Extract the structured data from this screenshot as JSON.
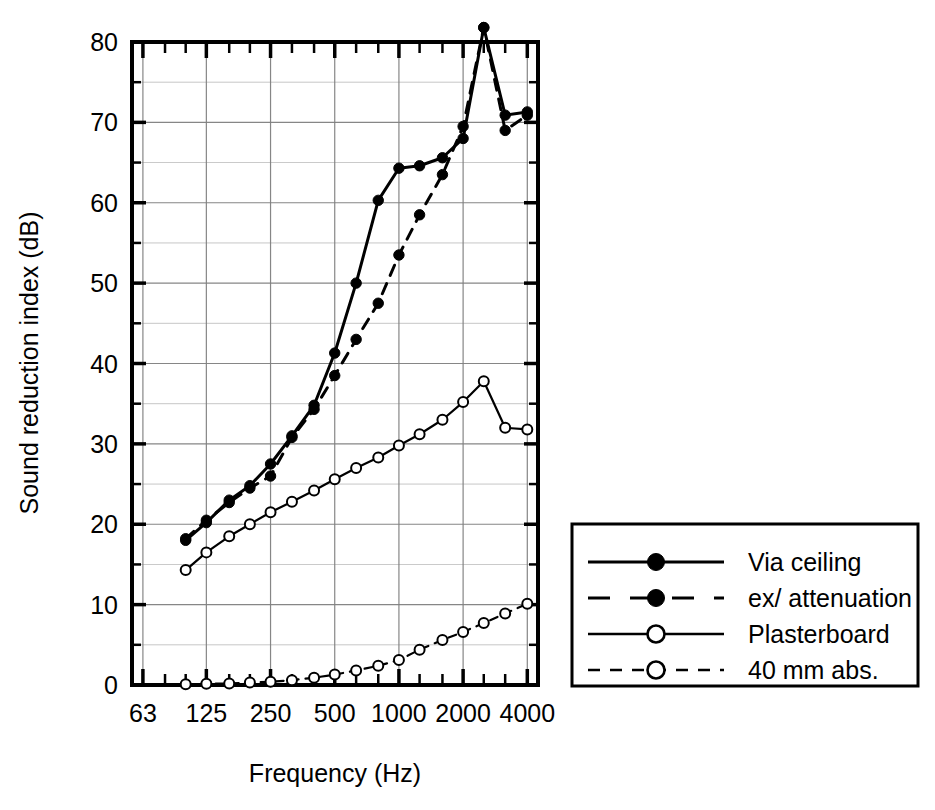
{
  "chart_data": {
    "type": "line",
    "title": "",
    "xlabel": "Frequency (Hz)",
    "ylabel": "Sound reduction index (dB)",
    "xscale": "log",
    "xlim": [
      56,
      4490
    ],
    "ylim": [
      0,
      80
    ],
    "yticks": [
      0,
      10,
      20,
      30,
      40,
      50,
      60,
      70,
      80
    ],
    "ytick_labels": [
      "0",
      "10",
      "20",
      "30",
      "40",
      "50",
      "60",
      "70",
      "80"
    ],
    "yminor_step": 5,
    "xticks": [
      63,
      125,
      250,
      500,
      1000,
      2000,
      4000
    ],
    "xtick_labels": [
      "63",
      "125",
      "250",
      "500",
      "1000",
      "2000",
      "4000"
    ],
    "xminor_ticks": [
      80,
      100,
      160,
      200,
      315,
      400,
      630,
      800,
      1250,
      1600,
      2500,
      3150
    ],
    "grid": true,
    "grid_axes": "both",
    "legend_position": "outside-right-bottom",
    "x": [
      100,
      125,
      160,
      200,
      250,
      315,
      400,
      500,
      630,
      800,
      1000,
      1250,
      1600,
      2000,
      2500,
      3150,
      4000
    ],
    "series": [
      {
        "name": "Via ceiling",
        "style": "solid",
        "marker": "filled-circle",
        "values": [
          18.0,
          20.2,
          23.0,
          24.8,
          27.5,
          31.0,
          34.8,
          41.3,
          50.0,
          60.3,
          64.3,
          64.6,
          65.6,
          68.0,
          72.6,
          77.3,
          81.8
        ]
      },
      {
        "name": "ex/ attenuation",
        "style": "dashed",
        "marker": "filled-circle",
        "values": [
          18.2,
          20.5,
          22.7,
          24.5,
          26.0,
          30.8,
          34.3,
          38.5,
          43.0,
          47.5,
          53.5,
          58.5,
          63.5,
          69.5,
          75.5,
          81.8,
          70.8
        ]
      },
      {
        "name": "Plasterboard",
        "style": "solid",
        "marker": "open-circle",
        "values": [
          14.3,
          16.5,
          18.5,
          20.0,
          21.5,
          22.8,
          24.2,
          25.6,
          27.0,
          28.3,
          29.8,
          31.2,
          33.0,
          35.2,
          37.8,
          32.0,
          31.8
        ]
      },
      {
        "name": "40 mm abs.",
        "style": "dashed",
        "marker": "open-circle",
        "values": [
          0.1,
          0.15,
          0.2,
          0.3,
          0.4,
          0.6,
          0.9,
          1.3,
          1.8,
          2.4,
          3.1,
          4.4,
          5.6,
          6.6,
          7.7,
          8.9,
          10.1
        ]
      }
    ],
    "extra_points": [
      {
        "series": "Via ceiling",
        "x": 3150,
        "y": 70.9,
        "note": "post-peak drop"
      },
      {
        "series": "Via ceiling",
        "x": 4000,
        "y": 71.3,
        "note": "final"
      },
      {
        "series": "ex/ attenuation",
        "x": 3150,
        "y": 69.0,
        "note": "post-peak drop"
      },
      {
        "series": "ex/ attenuation",
        "x": 4000,
        "y": 70.9,
        "note": "final"
      }
    ]
  },
  "legend": {
    "items": [
      {
        "label": "Via ceiling",
        "style": "solid",
        "marker": "filled-circle"
      },
      {
        "label": "ex/ attenuation",
        "style": "dashed",
        "marker": "filled-circle"
      },
      {
        "label": "Plasterboard",
        "style": "solid",
        "marker": "open-circle"
      },
      {
        "label": "40 mm abs.",
        "style": "dashed",
        "marker": "open-circle"
      }
    ]
  },
  "colors": {
    "line": "#000000",
    "grid": "#808080",
    "axis": "#000000",
    "background": "#ffffff"
  }
}
